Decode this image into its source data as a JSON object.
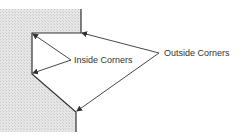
{
  "diagram": {
    "labels": {
      "inside": "Inside Corners",
      "outside": "Outside Corners"
    },
    "colors": {
      "line": "#333333",
      "hatch_light": "#e6e6e6",
      "hatch_dark": "#c9c9c9",
      "background": "#ffffff"
    },
    "shape": {
      "outline_points": [
        [
          81,
          9
        ],
        [
          81,
          33
        ],
        [
          32,
          33
        ],
        [
          32,
          74
        ],
        [
          76,
          112
        ],
        [
          76,
          132
        ]
      ]
    },
    "inside_corner_arrows": {
      "origin": [
        71,
        60
      ],
      "targets": [
        [
          32,
          33
        ],
        [
          32,
          74
        ]
      ]
    },
    "outside_corner_arrows": {
      "origin": [
        159,
        53
      ],
      "targets": [
        [
          81,
          33
        ],
        [
          76,
          112
        ]
      ]
    }
  }
}
